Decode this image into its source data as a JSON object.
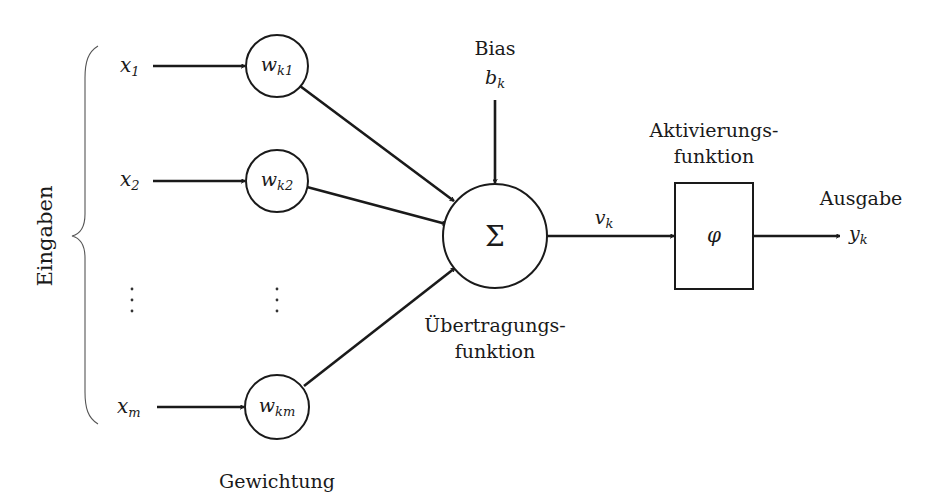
{
  "diagram": {
    "colors": {
      "stroke": "#1a1a1a",
      "background": "#ffffff",
      "brace": "#555555"
    },
    "inputs_group_label": "Eingaben",
    "weights_group_label": "Gewichtung",
    "inputs": [
      {
        "var": "x",
        "sub": "1",
        "weight_var": "w",
        "weight_sub": "k1"
      },
      {
        "var": "x",
        "sub": "2",
        "weight_var": "w",
        "weight_sub": "k2"
      },
      {
        "var": "x",
        "sub": "m",
        "weight_var": "w",
        "weight_sub": "km"
      }
    ],
    "ellipsis": "⋮",
    "bias": {
      "label": "Bias",
      "var": "b",
      "sub": "k"
    },
    "sum_node": {
      "symbol": "Σ",
      "label_line1": "Übertragungs-",
      "label_line2": "funktion"
    },
    "net_output": {
      "var": "v",
      "sub": "k"
    },
    "activation": {
      "symbol": "φ",
      "label_line1": "Aktivierungs-",
      "label_line2": "funktion"
    },
    "output": {
      "label": "Ausgabe",
      "var": "y",
      "sub": "k"
    }
  }
}
